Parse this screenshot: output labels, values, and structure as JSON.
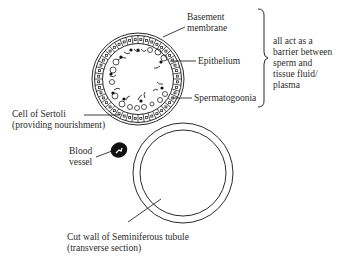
{
  "diagram": {
    "labels": {
      "basement_membrane": [
        "Basement",
        "membrane"
      ],
      "epithelium": "Epithelium",
      "spermatogonia": "Spermatogoonia",
      "sertoli": [
        "Cell of Sertoli",
        "(providing nourishment)"
      ],
      "blood_vessel": [
        "Blood",
        "vessel"
      ],
      "cut_wall": [
        "Cut wall of Seminiferous tubule",
        "(transverse section)"
      ],
      "barrier_note": [
        "all act as a",
        "barrier between",
        "sperm and",
        "tissue fluid/",
        "plasma"
      ]
    },
    "colors": {
      "line": "#2a2a2a",
      "background": "#ffffff",
      "blood_vessel_fill": "#111111"
    }
  }
}
